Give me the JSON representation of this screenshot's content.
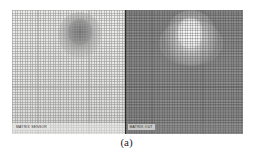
{
  "figure": {
    "caption": "(a)",
    "panels": [
      {
        "id": "matrix-sensor",
        "label": "MATRIX SENSOR",
        "background_color": "#e3e3e1",
        "blob": {
          "type": "dark",
          "color": "#707070",
          "position": "upper-center-left"
        },
        "overlay": "dot-matrix-grid"
      },
      {
        "id": "matrix-out",
        "label": "MATRIX OUT",
        "background_color": "#8d8d8d",
        "blob": {
          "type": "bright",
          "color": "#ffffff",
          "position": "upper-center"
        },
        "overlay": "dot-matrix-grid"
      }
    ],
    "divider_color": "#2b2b2b",
    "page_background": "#ffffff"
  }
}
